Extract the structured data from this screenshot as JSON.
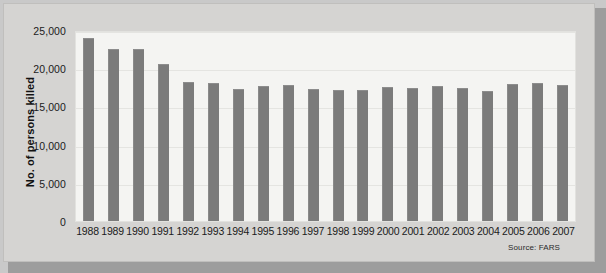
{
  "chart_data": {
    "type": "bar",
    "title": "",
    "subtitle": "",
    "xlabel": "",
    "ylabel": "No. of persons killed",
    "ylim": [
      0,
      25000
    ],
    "ytick_labels": [
      "25,000",
      "20,000",
      "15,000",
      "10,000",
      "5,000",
      "0"
    ],
    "ytick_values": [
      25000,
      20000,
      15000,
      10000,
      5000,
      0
    ],
    "grid": true,
    "legend": "none",
    "source_note": "Source: FARS",
    "categories": [
      "1988",
      "1989",
      "1990",
      "1991",
      "1992",
      "1993",
      "1994",
      "1995",
      "1996",
      "1997",
      "1998",
      "1999",
      "2000",
      "2001",
      "2002",
      "2003",
      "2004",
      "2005",
      "2006",
      "2007"
    ],
    "values": [
      23900,
      22450,
      22450,
      20600,
      18200,
      18100,
      17300,
      17700,
      17750,
      17250,
      17100,
      17200,
      17500,
      17400,
      17650,
      17400,
      17000,
      17900,
      18100,
      17800
    ],
    "colors": {
      "bar": "#7b7b7b",
      "plot_background": "#f4f4f2",
      "panel_background": "#d5d4d2",
      "gridline": "#e4e4e1",
      "text": "#1b1b1b",
      "shadow": "#9d9d9d"
    }
  }
}
